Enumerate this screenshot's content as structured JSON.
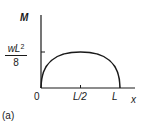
{
  "diagram": {
    "type": "bending-moment-diagram",
    "y_axis_label": "M",
    "x_axis_label": "x",
    "peak_value": {
      "numerator": "wL",
      "exponent": "2",
      "denominator": "8"
    },
    "x_ticks": [
      "0",
      "L/2",
      "L"
    ],
    "caption": "(a)",
    "curve": "parabola from 0 to L with maximum at L/2",
    "stroke_color": "#1a1a1a"
  }
}
